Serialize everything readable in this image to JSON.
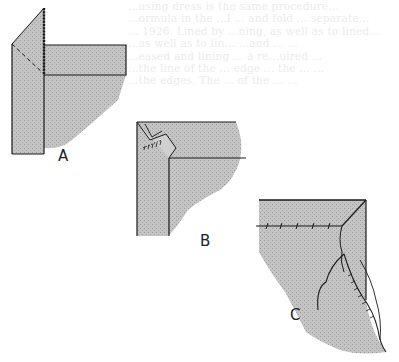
{
  "page": {
    "background": "#ffffff",
    "fabric_fill": "#bdbdbd",
    "line_color": "#1a1a1a"
  },
  "bleed_through_text": {
    "lines": [
      "...using dress is the same procedure...",
      "...ormula in the ...l ... and fold ... separate...",
      "... 1926. Lined by ...ning, as well as to lined...",
      "...as well as to lin... ...and ... ...",
      "...eased and lining ... a re...uired ...",
      "...the line of the ... edge ... the ... ...",
      "...the edges. The ... of the ... ..."
    ]
  },
  "figures": [
    {
      "id": "A",
      "label": "A",
      "description": "Facing folded up with diagonal dashed fold line and stitched edge"
    },
    {
      "id": "B",
      "label": "B",
      "description": "Corner folded with whipstitched miter"
    },
    {
      "id": "C",
      "label": "C",
      "description": "Finished mitered corner with hemmed lining edge"
    }
  ]
}
